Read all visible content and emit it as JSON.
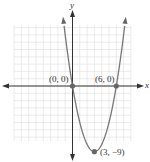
{
  "chart_data": {
    "type": "line",
    "title": "",
    "xlabel": "x",
    "ylabel": "y",
    "function": "y = x^2 - 6x",
    "grid": true,
    "xlim": [
      -8,
      8
    ],
    "ylim": [
      -10,
      8
    ],
    "series": [
      {
        "name": "parabola",
        "x": [
          -1.3,
          -1,
          0,
          1,
          2,
          3,
          4,
          5,
          6,
          7,
          7.3
        ],
        "y": [
          9.5,
          7,
          0,
          -5,
          -8,
          -9,
          -8,
          -5,
          0,
          7,
          9.5
        ]
      }
    ],
    "points": [
      {
        "label": "(0, 0)",
        "x": 0,
        "y": 0
      },
      {
        "label": "(6, 0)",
        "x": 6,
        "y": 0
      },
      {
        "label": "(3, −9)",
        "x": 3,
        "y": -9
      }
    ]
  },
  "labels": {
    "x_axis": "x",
    "y_axis": "y",
    "p1": "(0, 0)",
    "p2": "(6, 0)",
    "p3": "(3, −9)"
  },
  "colors": {
    "axis": "#333333",
    "curve": "#777777",
    "point": "#666666",
    "grid": "#dddddd"
  }
}
